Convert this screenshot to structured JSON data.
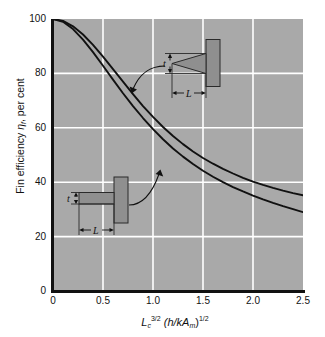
{
  "chart_data": {
    "type": "line",
    "title": "",
    "xlabel_parts": {
      "base1": "L",
      "sub1": "c",
      "sup1": "3/2",
      "mid": "(h/kA",
      "sub2": "m",
      "close": ")",
      "sup2": "1/2",
      "plain": "Lc^3/2 (h/kAm)^1/2"
    },
    "ylabel_parts": {
      "pre": "Fin efficiency ",
      "eta": "η",
      "sub": "f",
      "post": ", per cent",
      "plain": "Fin efficiency ηf, per cent"
    },
    "xlim": [
      0,
      2.5
    ],
    "ylim": [
      0,
      100
    ],
    "xticks": [
      "0",
      "0.5",
      "1.0",
      "1.5",
      "2.0",
      "2.5"
    ],
    "xtick_values": [
      0,
      0.5,
      1.0,
      1.5,
      2.0,
      2.5
    ],
    "yticks": [
      "0",
      "20",
      "40",
      "60",
      "80",
      "100"
    ],
    "ytick_values": [
      0,
      20,
      40,
      60,
      80,
      100
    ],
    "grid": true,
    "grid_color": "#ffffff",
    "plot_bg": "#a9a9a9",
    "curve_color": "#111111",
    "legend": "none",
    "series": [
      {
        "name": "Triangular fin",
        "note": "upper curve - higher efficiency",
        "x": [
          0.0,
          0.1,
          0.2,
          0.3,
          0.4,
          0.5,
          0.6,
          0.7,
          0.8,
          0.9,
          1.0,
          1.1,
          1.2,
          1.3,
          1.4,
          1.5,
          1.6,
          1.7,
          1.8,
          1.9,
          2.0,
          2.1,
          2.2,
          2.3,
          2.4,
          2.5
        ],
        "values": [
          100.0,
          99.3,
          97.3,
          94.3,
          90.5,
          86.2,
          81.6,
          77.0,
          72.4,
          68.0,
          64.0,
          60.3,
          57.0,
          54.0,
          51.3,
          48.9,
          46.8,
          44.9,
          43.2,
          41.6,
          40.2,
          39.0,
          37.9,
          36.9,
          36.0,
          35.2
        ]
      },
      {
        "name": "Rectangular fin",
        "note": "lower curve - straight fin",
        "x": [
          0.0,
          0.1,
          0.2,
          0.3,
          0.4,
          0.5,
          0.6,
          0.7,
          0.8,
          0.9,
          1.0,
          1.1,
          1.2,
          1.3,
          1.4,
          1.5,
          1.6,
          1.7,
          1.8,
          1.9,
          2.0,
          2.1,
          2.2,
          2.3,
          2.4,
          2.5
        ],
        "values": [
          100.0,
          99.0,
          96.3,
          92.4,
          87.8,
          82.8,
          77.7,
          72.7,
          68.0,
          63.6,
          59.5,
          55.8,
          52.4,
          49.4,
          46.7,
          44.2,
          42.0,
          40.0,
          38.2,
          36.6,
          35.1,
          33.7,
          32.4,
          31.2,
          30.1,
          29.0
        ]
      }
    ],
    "annotations": [
      {
        "name": "triangular-fin-diagram",
        "labels": {
          "thickness": "t",
          "length": "L"
        },
        "points_to_series": "Triangular fin"
      },
      {
        "name": "rectangular-fin-diagram",
        "labels": {
          "thickness": "t",
          "length": "L"
        },
        "points_to_series": "Rectangular fin"
      }
    ]
  }
}
